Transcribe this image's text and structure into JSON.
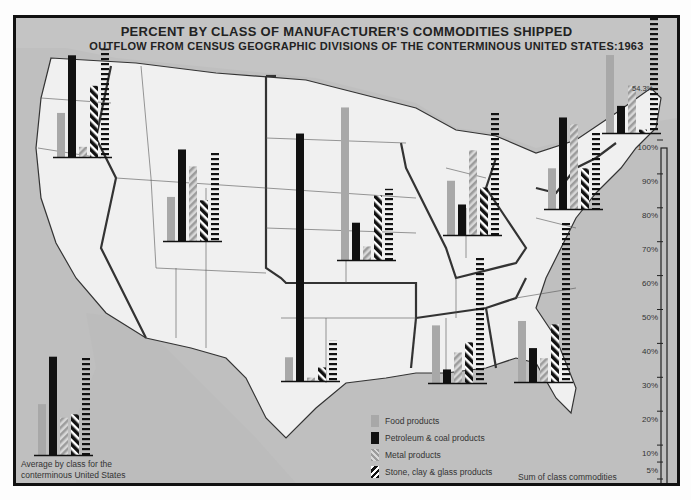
{
  "chart_data": {
    "type": "bar",
    "title": "PERCENT BY CLASS OF MANUFACTURER'S COMMODITIES SHIPPED",
    "subtitle": "OUTFLOW FROM CENSUS GEOGRAPHIC DIVISIONS OF THE CONTERMINOUS UNITED STATES:1963",
    "xlabel": "",
    "ylabel": "Percent",
    "ylim": [
      0,
      100
    ],
    "y_ticks": [
      "0",
      "5%",
      "10%",
      "20%",
      "30%",
      "40%",
      "50%",
      "60%",
      "70%",
      "80%",
      "90%",
      "100%"
    ],
    "categories": [
      "Food products",
      "Petroleum & coal products",
      "Metal products",
      "Stone, clay & glass products",
      "All other products"
    ],
    "legend_position": "bottom-center",
    "series": [
      {
        "name": "Pacific",
        "values": [
          13,
          30,
          3,
          21,
          32
        ]
      },
      {
        "name": "Mountain",
        "values": [
          13,
          27,
          22,
          12,
          26
        ]
      },
      {
        "name": "West North Central",
        "values": [
          45,
          11,
          4,
          19,
          21
        ]
      },
      {
        "name": "West South Central",
        "values": [
          7,
          73,
          1,
          4,
          12
        ]
      },
      {
        "name": "East North Central",
        "values": [
          16,
          9,
          25,
          14,
          36
        ]
      },
      {
        "name": "East South Central",
        "values": [
          17,
          4,
          9,
          12,
          37
        ]
      },
      {
        "name": "South Atlantic",
        "values": [
          18,
          10,
          7,
          17,
          47
        ]
      },
      {
        "name": "Middle Atlantic",
        "values": [
          12,
          27,
          25,
          12,
          23
        ]
      },
      {
        "name": "New England",
        "values": [
          23,
          8,
          14,
          1,
          54.3
        ]
      },
      {
        "name": "Average conterminous United States",
        "values": [
          15,
          29,
          11,
          12,
          29
        ]
      }
    ],
    "annotations": [
      "54.3%",
      "Average by class for the conterminous United States",
      "Sum of class commodities equal to 100% for each Census geographic division,"
    ]
  },
  "title": "PERCENT BY CLASS OF MANUFACTURER'S COMMODITIES SHIPPED",
  "subtitle": "OUTFLOW FROM CENSUS GEOGRAPHIC DIVISIONS OF THE CONTERMINOUS UNITED STATES:1963",
  "legend": {
    "food": "Food products",
    "petroleum": "Petroleum & coal products",
    "metal": "Metal products",
    "stone": "Stone, clay & glass products",
    "other": "All other products"
  },
  "notes": {
    "average_line1": "Average by class for the",
    "average_line2": "conterminous United States",
    "sum_line1": "Sum of class commodities",
    "sum_line2": "equal to 100%  for each",
    "sum_line3": "Census geographic division,",
    "ne_other_label": "54.3%"
  },
  "scale": {
    "t100": "100%",
    "t90": "90%",
    "t80": "80%",
    "t70": "70%",
    "t60": "60%",
    "t50": "50%",
    "t40": "40%",
    "t30": "30%",
    "t20": "20%",
    "t10": "10%",
    "t5": "5%",
    "t0": "0"
  },
  "colors": {
    "food": "#a8a8a8",
    "petroleum": "#111111",
    "metal": "#b8b8b8",
    "stone": "#111111",
    "other": "#111111",
    "land": "#efefef",
    "water": "#bdbdbd"
  }
}
